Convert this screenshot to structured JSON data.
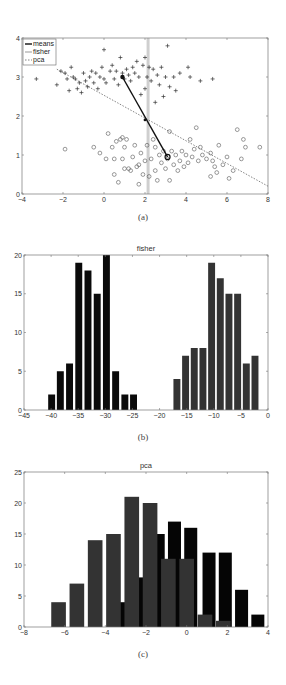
{
  "chart_data": [
    {
      "id": "a",
      "type": "scatter",
      "caption": "(a)",
      "title": "",
      "xlim": [
        -4,
        8
      ],
      "ylim": [
        0,
        4
      ],
      "xticks": [
        "-4",
        "-2",
        "0",
        "2",
        "4",
        "6",
        "8"
      ],
      "yticks": [
        "0",
        "1",
        "2",
        "3",
        "4"
      ],
      "legend": [
        "means",
        "fisher",
        "pca"
      ],
      "series": [
        {
          "name": "class1 (+)",
          "marker": "+",
          "points": [
            [
              -3.3,
              2.95
            ],
            [
              -2.3,
              2.8
            ],
            [
              -2.1,
              3.15
            ],
            [
              -1.9,
              3.1
            ],
            [
              -1.8,
              2.95
            ],
            [
              -1.7,
              2.65
            ],
            [
              -1.6,
              3.25
            ],
            [
              -1.5,
              3.0
            ],
            [
              -1.4,
              2.95
            ],
            [
              -1.3,
              2.7
            ],
            [
              -1.2,
              2.85
            ],
            [
              -1.1,
              2.6
            ],
            [
              -1.0,
              3.1
            ],
            [
              -0.9,
              2.9
            ],
            [
              -0.8,
              2.75
            ],
            [
              -0.7,
              3.0
            ],
            [
              -0.6,
              3.15
            ],
            [
              -0.5,
              2.85
            ],
            [
              -0.4,
              3.1
            ],
            [
              -0.3,
              2.7
            ],
            [
              -0.2,
              3.0
            ],
            [
              -0.1,
              3.25
            ],
            [
              0.0,
              2.95
            ],
            [
              0.0,
              3.7
            ],
            [
              0.1,
              2.85
            ],
            [
              0.3,
              3.15
            ],
            [
              0.4,
              3.3
            ],
            [
              0.5,
              2.95
            ],
            [
              0.6,
              3.15
            ],
            [
              0.7,
              2.8
            ],
            [
              0.8,
              3.5
            ],
            [
              0.9,
              3.1
            ],
            [
              1.0,
              2.95
            ],
            [
              1.1,
              3.2
            ],
            [
              1.2,
              3.05
            ],
            [
              1.3,
              2.9
            ],
            [
              1.4,
              3.25
            ],
            [
              1.5,
              3.1
            ],
            [
              1.6,
              3.4
            ],
            [
              1.7,
              3.0
            ],
            [
              1.8,
              2.55
            ],
            [
              1.9,
              3.3
            ],
            [
              2.0,
              2.7
            ],
            [
              2.0,
              3.5
            ],
            [
              2.1,
              3.0
            ],
            [
              2.2,
              3.25
            ],
            [
              2.3,
              2.9
            ],
            [
              2.4,
              3.2
            ],
            [
              2.5,
              2.35
            ],
            [
              2.6,
              3.05
            ],
            [
              2.7,
              2.8
            ],
            [
              2.8,
              3.25
            ],
            [
              2.9,
              2.5
            ],
            [
              3.0,
              3.0
            ],
            [
              3.1,
              3.8
            ],
            [
              3.2,
              2.75
            ],
            [
              3.4,
              3.0
            ],
            [
              3.5,
              2.65
            ],
            [
              3.7,
              3.1
            ],
            [
              4.1,
              3.25
            ],
            [
              4.2,
              3.0
            ],
            [
              4.7,
              2.9
            ],
            [
              5.3,
              2.95
            ]
          ]
        },
        {
          "name": "class2 (o)",
          "marker": "o",
          "points": [
            [
              -1.9,
              1.15
            ],
            [
              -0.5,
              1.2
            ],
            [
              -0.2,
              1.05
            ],
            [
              0.1,
              0.9
            ],
            [
              0.2,
              1.55
            ],
            [
              0.4,
              1.2
            ],
            [
              0.5,
              0.9
            ],
            [
              0.5,
              0.5
            ],
            [
              0.6,
              1.35
            ],
            [
              0.7,
              0.3
            ],
            [
              0.8,
              1.4
            ],
            [
              0.9,
              1.45
            ],
            [
              0.9,
              0.9
            ],
            [
              1.0,
              0.65
            ],
            [
              1.0,
              1.2
            ],
            [
              1.1,
              1.4
            ],
            [
              1.2,
              0.65
            ],
            [
              1.3,
              0.6
            ],
            [
              1.4,
              0.95
            ],
            [
              1.5,
              1.25
            ],
            [
              1.6,
              0.7
            ],
            [
              1.7,
              0.75
            ],
            [
              1.7,
              0.25
            ],
            [
              1.8,
              1.05
            ],
            [
              1.9,
              0.5
            ],
            [
              2.0,
              0.85
            ],
            [
              2.1,
              1.25
            ],
            [
              2.2,
              0.45
            ],
            [
              2.3,
              0.9
            ],
            [
              2.4,
              1.4
            ],
            [
              2.5,
              0.6
            ],
            [
              2.5,
              1.2
            ],
            [
              2.6,
              0.35
            ],
            [
              2.7,
              1.0
            ],
            [
              2.8,
              0.8
            ],
            [
              2.9,
              1.1
            ],
            [
              3.0,
              0.65
            ],
            [
              3.1,
              0.9
            ],
            [
              3.2,
              0.35
            ],
            [
              3.2,
              1.6
            ],
            [
              3.3,
              1.1
            ],
            [
              3.4,
              0.75
            ],
            [
              3.5,
              1.0
            ],
            [
              3.6,
              0.6
            ],
            [
              3.7,
              0.85
            ],
            [
              3.8,
              1.1
            ],
            [
              3.9,
              0.7
            ],
            [
              4.0,
              1.0
            ],
            [
              4.1,
              0.8
            ],
            [
              4.2,
              1.4
            ],
            [
              4.3,
              0.95
            ],
            [
              4.4,
              1.15
            ],
            [
              4.5,
              1.7
            ],
            [
              4.6,
              0.85
            ],
            [
              4.7,
              1.2
            ],
            [
              4.8,
              1.0
            ],
            [
              5.0,
              0.9
            ],
            [
              5.2,
              1.05
            ],
            [
              5.2,
              0.45
            ],
            [
              5.3,
              0.85
            ],
            [
              5.4,
              0.7
            ],
            [
              5.5,
              0.55
            ],
            [
              5.6,
              1.25
            ],
            [
              5.8,
              0.75
            ],
            [
              6.0,
              0.95
            ],
            [
              6.1,
              0.4
            ],
            [
              6.3,
              0.6
            ],
            [
              6.5,
              1.65
            ],
            [
              6.7,
              0.9
            ],
            [
              6.8,
              1.4
            ],
            [
              6.9,
              1.2
            ],
            [
              7.6,
              1.2
            ]
          ]
        }
      ],
      "means_line": [
        [
          0.9,
          3.0
        ],
        [
          3.1,
          0.95
        ]
      ],
      "fisher_line": {
        "x": 2.15
      },
      "pca_line": [
        [
          -2.3,
          3.2
        ],
        [
          8.0,
          0.2
        ]
      ]
    },
    {
      "id": "b",
      "type": "bar",
      "caption": "(b)",
      "title": "fisher",
      "xlim": [
        -45,
        0
      ],
      "ylim": [
        0,
        20
      ],
      "xticks": [
        "-45",
        "-40",
        "-35",
        "-30",
        "-25",
        "-20",
        "-15",
        "-10",
        "-5",
        "0"
      ],
      "yticks": [
        "0",
        "5",
        "10",
        "15",
        "20"
      ],
      "series": [
        {
          "name": "class1",
          "color": "#0a0a0a",
          "centers": [
            -39.9,
            -38.3,
            -36.6,
            -34.9,
            -33.2,
            -31.5,
            -29.8,
            -28.1,
            -26.4,
            -24.8
          ],
          "values": [
            2,
            5,
            6,
            19,
            18,
            15,
            20,
            5,
            2,
            2
          ]
        },
        {
          "name": "class2",
          "color": "#333333",
          "centers": [
            -16.8,
            -15.2,
            -13.6,
            -12.0,
            -10.4,
            -8.8,
            -7.2,
            -5.6,
            -4.0,
            -2.4
          ],
          "values": [
            4,
            7,
            8,
            8,
            19,
            17,
            15,
            15,
            6,
            7
          ]
        }
      ]
    },
    {
      "id": "c",
      "type": "bar",
      "caption": "(c)",
      "title": "pca",
      "xlim": [
        -8,
        4
      ],
      "ylim": [
        0,
        25
      ],
      "xticks": [
        "-8",
        "-6",
        "-4",
        "-2",
        "0",
        "2",
        "4"
      ],
      "yticks": [
        "0",
        "5",
        "10",
        "15",
        "20",
        "25"
      ],
      "series": [
        {
          "name": "class1",
          "color": "#050505",
          "centers": [
            -3.0,
            -2.2,
            -1.4,
            -0.6,
            0.2,
            1.1,
            1.9,
            2.7,
            3.5
          ],
          "values": [
            4,
            8,
            15,
            17,
            16,
            12,
            12,
            6,
            2
          ]
        },
        {
          "name": "class2",
          "color": "#333333",
          "centers": [
            -6.3,
            -5.4,
            -4.5,
            -3.6,
            -2.7,
            -1.8,
            -0.9,
            0.0,
            0.9,
            1.8
          ],
          "values": [
            4,
            7,
            14,
            15,
            21,
            20,
            11,
            11,
            2,
            1
          ]
        }
      ]
    }
  ]
}
